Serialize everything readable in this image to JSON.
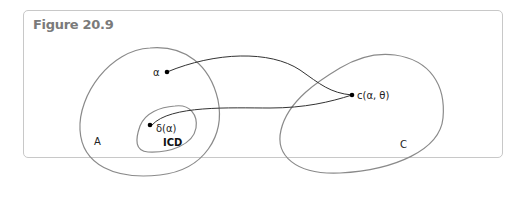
{
  "figure": {
    "title": "Figure 20.9"
  },
  "diagram": {
    "sets": [
      {
        "id": "A",
        "label": "A"
      },
      {
        "id": "ICD",
        "label": "ICD"
      },
      {
        "id": "C",
        "label": "C"
      }
    ],
    "points": [
      {
        "id": "alpha",
        "label": "α"
      },
      {
        "id": "delta-alpha",
        "label": "δ(α)"
      },
      {
        "id": "c-alpha-theta",
        "label": "c(α, θ)"
      }
    ],
    "edges": [
      {
        "from": "alpha",
        "to": "c-alpha-theta"
      },
      {
        "from": "delta-alpha",
        "to": "c-alpha-theta"
      }
    ]
  }
}
